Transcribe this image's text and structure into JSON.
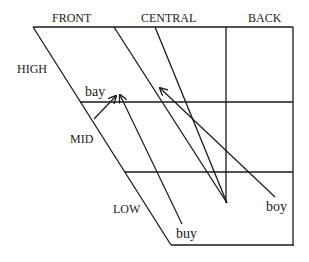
{
  "diagram": {
    "type": "vowel-quadrilateral",
    "column_labels": {
      "front": "FRONT",
      "central": "CENTRAL",
      "back": "BACK"
    },
    "row_labels": {
      "high": "HIGH",
      "mid": "MID",
      "low": "LOW"
    },
    "diphthongs": [
      {
        "id": "bay",
        "label": "bay"
      },
      {
        "id": "buy",
        "label": "buy"
      },
      {
        "id": "boy",
        "label": "boy"
      }
    ],
    "colors": {
      "line": "#1a1a1a",
      "background": "#ffffff"
    }
  }
}
